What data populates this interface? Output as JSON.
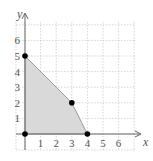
{
  "chart_data": {
    "type": "area",
    "title": "",
    "xlabel": "x",
    "ylabel": "y",
    "xlim": [
      0,
      7
    ],
    "ylim": [
      0,
      7
    ],
    "grid": true,
    "x_ticks": [
      "1",
      "2",
      "3",
      "4",
      "5",
      "6"
    ],
    "y_ticks": [
      "1",
      "2",
      "3",
      "4",
      "5",
      "6"
    ],
    "region_vertices": [
      [
        0,
        0
      ],
      [
        0,
        5
      ],
      [
        3,
        2
      ],
      [
        4,
        0
      ]
    ],
    "points": [
      {
        "x": 0,
        "y": 0
      },
      {
        "x": 0,
        "y": 5
      },
      {
        "x": 3,
        "y": 2
      },
      {
        "x": 4,
        "y": 0
      }
    ],
    "colors": {
      "region_fill": "#d9d9d9",
      "boundary": "#888888",
      "point": "#000000",
      "grid": "#bbbbbb",
      "axis": "#666666"
    }
  },
  "labels": {
    "x_axis": "x",
    "y_axis": "y"
  }
}
